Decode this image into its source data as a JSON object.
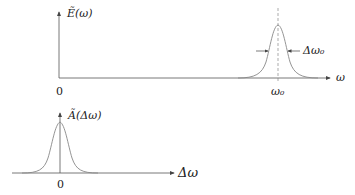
{
  "top_plot": {
    "y_label": "Ẽ(ω)",
    "x_label": "ω",
    "origin_label": "0",
    "peak_tick_label": "ω₀",
    "width_label": "Δω₀"
  },
  "bottom_plot": {
    "y_label": "Ã(Δω)",
    "x_label": "Δω",
    "origin_label": "0"
  },
  "colors": {
    "axis": "#555555",
    "curve": "#888888",
    "dashed": "#888888"
  }
}
